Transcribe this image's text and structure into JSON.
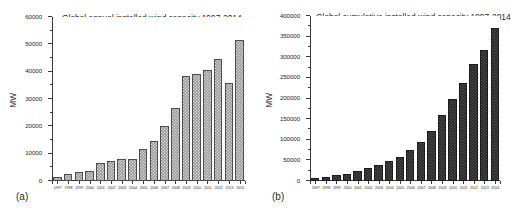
{
  "figure": {
    "background": "#ffffff",
    "bar_color_a": "#9a9a9a",
    "bar_color_b": "#2b2b2b",
    "axis_color": "#3b3b3b"
  },
  "panels": [
    {
      "panel_label": "(a)",
      "chart_data": {
        "type": "bar",
        "title": "Global annual installed wind capacity 1997-2014",
        "xlabel": "",
        "ylabel": "MW",
        "ylim": [
          0,
          60000
        ],
        "yticks": [
          0,
          10000,
          20000,
          30000,
          40000,
          50000,
          60000
        ],
        "ytick_labels": [
          "0",
          "10000",
          "20000",
          "30000",
          "40000",
          "50000",
          "60000"
        ],
        "grid": false,
        "legend": null,
        "categories": [
          "1997",
          "1998",
          "1999",
          "2000",
          "2001",
          "2002",
          "2003",
          "2004",
          "2005",
          "2006",
          "2007",
          "2008",
          "2009",
          "2010",
          "2011",
          "2012",
          "2013",
          "2014"
        ],
        "values": [
          1530,
          2520,
          3440,
          3760,
          6500,
          7270,
          8133,
          8207,
          11531,
          14703,
          20286,
          26874,
          38475,
          39062,
          40635,
          44799,
          35776,
          51477
        ]
      }
    },
    {
      "panel_label": "(b)",
      "chart_data": {
        "type": "bar",
        "title": "Global cumulative installed wind capacity 1997-2014",
        "xlabel": "",
        "ylabel": "MW",
        "ylim": [
          0,
          400000
        ],
        "yticks": [
          0,
          50000,
          100000,
          150000,
          200000,
          250000,
          300000,
          350000,
          400000
        ],
        "ytick_labels": [
          "0",
          "50000",
          "100000",
          "150000",
          "200000",
          "250000",
          "300000",
          "350000",
          "400000"
        ],
        "grid": false,
        "legend": null,
        "categories": [
          "1997",
          "1998",
          "1999",
          "2000",
          "2001",
          "2002",
          "2003",
          "2004",
          "2005",
          "2006",
          "2007",
          "2008",
          "2009",
          "2010",
          "2011",
          "2012",
          "2013",
          "2014"
        ],
        "values": [
          7600,
          10200,
          13600,
          17400,
          23900,
          31100,
          39431,
          47620,
          59091,
          74052,
          93820,
          120550,
          159982,
          197900,
          238351,
          282770,
          318644,
          369862
        ]
      }
    }
  ]
}
